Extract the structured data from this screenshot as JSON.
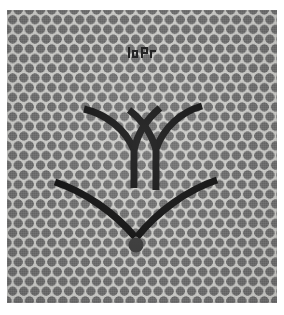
{
  "image": {
    "kind": "fabric-swatch-photo",
    "alt": "Grey fabric swatch with polka dot halftone pattern and dark chevron motif",
    "width": 284,
    "height": 315,
    "background_color": "#ffffff"
  },
  "swatch": {
    "label": "fabric panel",
    "base_color": "#c9c9c6",
    "dot_color": "#6d6d6d",
    "dot_diameter_px": 9,
    "dot_pitch_px": 11,
    "pattern": "staggered polka dot halftone",
    "left": 7,
    "top": 10,
    "width": 270,
    "height": 293
  },
  "motif": {
    "label": "chevron embroidery motif",
    "stroke_color": "#141414",
    "stroke_width_px": 7,
    "parts": [
      {
        "name": "left-branch",
        "shape": "curved Y arm descending right into vertical stem"
      },
      {
        "name": "right-branch",
        "shape": "mirrored curved Y arm descending left into vertical stem"
      },
      {
        "name": "lower-chevron",
        "shape": "wide V sweeping down to a centre vertex"
      },
      {
        "name": "vertex-dot",
        "shape": "filled circle at the base of the V",
        "diameter_px": 14
      }
    ]
  },
  "logo": {
    "label": "small printed mark",
    "color": "#1d1d1d",
    "left": 120,
    "top": 36,
    "width": 30,
    "height": 14
  }
}
